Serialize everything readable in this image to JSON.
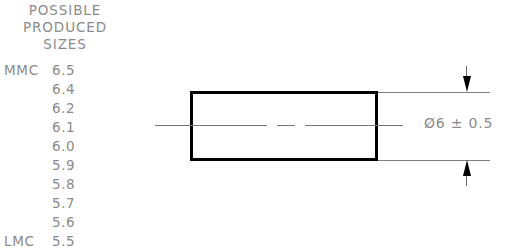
{
  "drawing": {
    "title_lines": [
      "POSSIBLE",
      "PRODUCED",
      "SIZES"
    ],
    "size_table": {
      "rows": [
        {
          "tag": "MMC",
          "value": "6.5"
        },
        {
          "tag": "",
          "value": "6.4"
        },
        {
          "tag": "",
          "value": "6.2"
        },
        {
          "tag": "",
          "value": "6.1"
        },
        {
          "tag": "",
          "value": "6.0"
        },
        {
          "tag": "",
          "value": "5.9"
        },
        {
          "tag": "",
          "value": "5.8"
        },
        {
          "tag": "",
          "value": "5.7"
        },
        {
          "tag": "",
          "value": "5.6"
        },
        {
          "tag": "LMC",
          "value": "5.5"
        }
      ]
    },
    "dimension": {
      "text": "Ø6 ± 0.5",
      "diameter_symbol": "Ø",
      "nominal": "6",
      "tolerance": "± 0.5"
    },
    "colors": {
      "text": "#8b8b8b",
      "part_outline": "#000000",
      "thin_line": "#7d7d7d",
      "background": "#ffffff"
    }
  }
}
